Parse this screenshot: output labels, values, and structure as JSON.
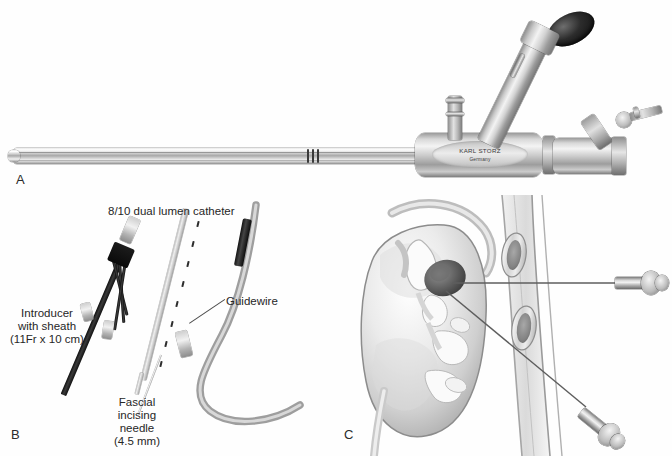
{
  "figure": {
    "panels": [
      {
        "letter": "A",
        "name": "rigid-nephroscope",
        "brand_line1": "KARL STORZ",
        "brand_line2": "Germany"
      },
      {
        "letter": "B",
        "name": "percutaneous-access-set",
        "labels": {
          "catheter": "8/10 dual lumen catheter",
          "guidewire": "Guidewire",
          "introducer_line1": "Introducer",
          "introducer_line2": "with sheath",
          "introducer_line3": "(11Fr x 10 cm)",
          "needle_line1": "Fascial",
          "needle_line2": "incising",
          "needle_line3": "needle",
          "needle_line4": "(4.5 mm)"
        }
      },
      {
        "letter": "C",
        "name": "percutaneous-renal-access-diagram"
      }
    ],
    "colors": {
      "background": "#fefefe",
      "text": "#262626",
      "metal_light": "#f2f2f2",
      "metal_mid": "#b4b4b4",
      "metal_dark": "#6f6f6f",
      "black_part": "#111111",
      "leader_line": "#4a4a4a",
      "tissue_outline": "#8c8c8c"
    }
  }
}
